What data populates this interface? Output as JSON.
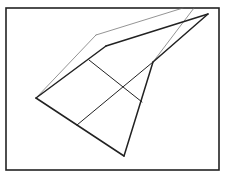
{
  "diagram": {
    "type": "geometric-figure",
    "frame": {
      "x": 6,
      "y": 8,
      "width": 213,
      "height": 162,
      "stroke": "#222222",
      "stroke_width": 1.6
    },
    "vertices": {
      "left": [
        36,
        98
      ],
      "bottom": [
        124,
        156
      ],
      "crease": [
        153,
        62
      ],
      "top_right": [
        208,
        14
      ],
      "bend_thick": [
        106,
        46
      ],
      "bend_thin": [
        96,
        35
      ],
      "thin_top_a": [
        183,
        8
      ],
      "thin_top_b": [
        194,
        8
      ],
      "cross_a_start": [
        89,
        60
      ],
      "cross_a_end": [
        142,
        102
      ],
      "cross_b_start": [
        77,
        125
      ],
      "cross_b_end": [
        153,
        62
      ]
    },
    "thick_lines": [
      {
        "name": "left-to-bend",
        "points": [
          [
            36,
            98
          ],
          [
            106,
            46
          ]
        ]
      },
      {
        "name": "bend-to-top-right",
        "points": [
          [
            106,
            46
          ],
          [
            208,
            14
          ]
        ]
      },
      {
        "name": "left-to-bottom",
        "points": [
          [
            36,
            98
          ],
          [
            124,
            156
          ]
        ]
      },
      {
        "name": "bottom-to-crease",
        "points": [
          [
            124,
            156
          ],
          [
            153,
            62
          ]
        ]
      },
      {
        "name": "crease-to-top-right",
        "points": [
          [
            153,
            62
          ],
          [
            208,
            14
          ]
        ]
      }
    ],
    "medium_lines": [
      {
        "name": "cross-line-a",
        "points": [
          [
            89,
            60
          ],
          [
            142,
            102
          ]
        ]
      },
      {
        "name": "cross-line-b",
        "points": [
          [
            77,
            125
          ],
          [
            153,
            62
          ]
        ]
      }
    ],
    "thin_lines": [
      {
        "name": "thin-left-to-bend",
        "points": [
          [
            36,
            98
          ],
          [
            96,
            35
          ]
        ]
      },
      {
        "name": "thin-bend-to-top",
        "points": [
          [
            96,
            35
          ],
          [
            183,
            8
          ]
        ]
      },
      {
        "name": "thin-crease-to-top",
        "points": [
          [
            153,
            62
          ],
          [
            194,
            8
          ]
        ]
      }
    ],
    "colors": {
      "line": "#222222",
      "thin_line": "#666666",
      "background": "#ffffff"
    }
  }
}
